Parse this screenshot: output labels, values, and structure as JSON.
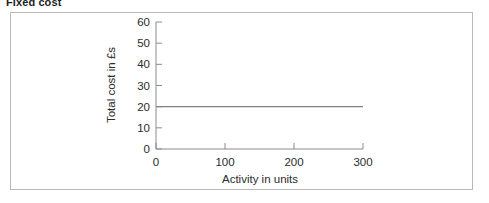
{
  "figure": {
    "title": "Fixed cost"
  },
  "chart_data": {
    "type": "line",
    "title": "Fixed cost",
    "xlabel": "Activity in units",
    "ylabel": "Total cost in £s",
    "xlim": [
      0,
      300
    ],
    "ylim": [
      0,
      60
    ],
    "xticks": [
      0,
      100,
      200,
      300
    ],
    "xtick_labels": [
      "0",
      "100",
      "200",
      "300"
    ],
    "yticks": [
      0,
      10,
      20,
      30,
      40,
      50,
      60
    ],
    "ytick_labels": [
      "0",
      "10",
      "20",
      "30",
      "40",
      "50",
      "60"
    ],
    "grid": false,
    "legend": false,
    "series": [
      {
        "name": "Fixed cost",
        "color": "#808080",
        "x": [
          0,
          300
        ],
        "values": [
          20,
          20
        ]
      }
    ],
    "annotations": []
  },
  "axis_style": {
    "axis_color": "#8c8c8c",
    "line_color": "#808080",
    "frame_color": "#b9b9b9",
    "background": "#ffffff"
  }
}
